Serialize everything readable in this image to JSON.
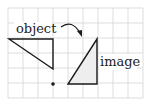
{
  "diagram": {
    "labels": {
      "object": "object",
      "image": "image"
    },
    "colors": {
      "grid": "#d4d4d4",
      "stroke": "#1a1a1a",
      "image_fill": "#eeeeee",
      "background": "#ffffff"
    },
    "grid": {
      "spacing": 15,
      "x0": 8,
      "y0": 8,
      "cols": 9,
      "rows": 6
    },
    "object_triangle": [
      [
        9,
        39
      ],
      [
        53,
        39
      ],
      [
        53,
        69
      ]
    ],
    "image_triangle": [
      [
        97,
        39
      ],
      [
        97,
        84
      ],
      [
        68,
        84
      ]
    ],
    "center_of_rotation": [
      53,
      84
    ],
    "arrow": "clockwise rotation arrow"
  }
}
